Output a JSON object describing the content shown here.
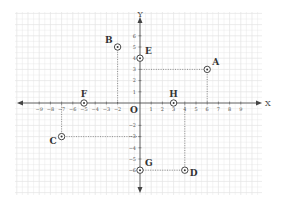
{
  "chart_data": {
    "type": "scatter",
    "title": "",
    "xlabel": "X",
    "ylabel": "Y",
    "origin_label": "O",
    "xlim": [
      -9,
      9
    ],
    "ylim": [
      -6,
      6
    ],
    "grid": true,
    "x_ticks": [
      -9,
      -8,
      -7,
      -6,
      -5,
      -4,
      -3,
      -2,
      1,
      2,
      3,
      4,
      5,
      6,
      7,
      8,
      9
    ],
    "y_ticks": [
      6,
      5,
      4,
      3,
      2,
      1,
      -2,
      -3,
      -4,
      -5,
      -6
    ],
    "points": [
      {
        "label": "A",
        "x": 6,
        "y": 3,
        "label_pos": "top-right",
        "projection": "both"
      },
      {
        "label": "B",
        "x": -2,
        "y": 5,
        "label_pos": "top-left",
        "projection": "to-x-axis"
      },
      {
        "label": "C",
        "x": -7,
        "y": -3,
        "label_pos": "bottom-left",
        "projection": "both"
      },
      {
        "label": "D",
        "x": 4,
        "y": -6,
        "label_pos": "bottom-right",
        "projection": "both"
      },
      {
        "label": "E",
        "x": 0,
        "y": 4,
        "label_pos": "top-right",
        "projection": "none"
      },
      {
        "label": "F",
        "x": -5,
        "y": 0,
        "label_pos": "top",
        "projection": "none"
      },
      {
        "label": "G",
        "x": 0,
        "y": -6,
        "label_pos": "top-right",
        "projection": "none"
      },
      {
        "label": "H",
        "x": 3,
        "y": 0,
        "label_pos": "top",
        "projection": "none"
      }
    ]
  },
  "colors": {
    "axis": "#444444",
    "grid": "#e4e4e4",
    "point": "#333333",
    "projection": "#777777"
  }
}
